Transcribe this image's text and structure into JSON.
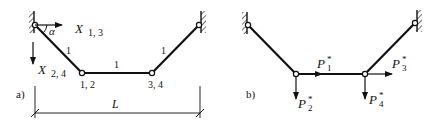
{
  "panel_a": {
    "label": "a)",
    "member_labels": [
      "1",
      "1",
      "1"
    ],
    "angle_label": "α",
    "unknown_horizontal": {
      "symbol": "X",
      "subscript": "1, 3"
    },
    "unknown_vertical": {
      "symbol": "X",
      "subscript": "2, 4"
    },
    "node_left_label": "1, 2",
    "node_right_label": "3, 4",
    "span_label": "L"
  },
  "panel_b": {
    "label": "b)",
    "loads": [
      {
        "symbol": "P",
        "subscript": "1",
        "superscript": "*"
      },
      {
        "symbol": "P",
        "subscript": "2",
        "superscript": "*"
      },
      {
        "symbol": "P",
        "subscript": "3",
        "superscript": "*"
      },
      {
        "symbol": "P",
        "subscript": "4",
        "superscript": "*"
      }
    ]
  },
  "colors": {
    "line": "#111111",
    "background": "#ffffff"
  }
}
